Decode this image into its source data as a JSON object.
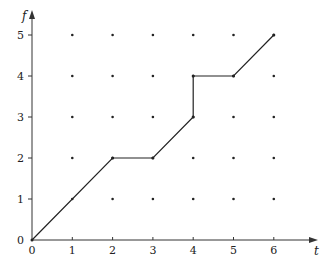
{
  "chart_data": {
    "type": "line",
    "title": "",
    "xlabel": "t",
    "ylabel": "f",
    "xlim": [
      0,
      6
    ],
    "ylim": [
      0,
      5
    ],
    "x_ticks": [
      "0",
      "1",
      "2",
      "3",
      "4",
      "5",
      "6"
    ],
    "y_ticks": [
      "0",
      "1",
      "2",
      "3",
      "4",
      "5"
    ],
    "grid": "integer lattice dots",
    "legend": null,
    "series": [
      {
        "name": "f(t)",
        "points": [
          [
            0,
            0
          ],
          [
            2,
            2
          ],
          [
            3,
            2
          ],
          [
            4,
            3
          ],
          [
            4,
            4
          ],
          [
            5,
            4
          ],
          [
            6,
            5
          ]
        ]
      }
    ],
    "lattice": {
      "x": [
        1,
        2,
        3,
        4,
        5,
        6
      ],
      "y": [
        1,
        2,
        3,
        4,
        5
      ]
    }
  },
  "colors": {
    "line": "#222222",
    "axis": "#333333",
    "dot": "#222222"
  }
}
